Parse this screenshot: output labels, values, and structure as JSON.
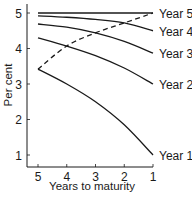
{
  "chart_data": {
    "type": "line",
    "title": "",
    "xlabel": "Years to maturity",
    "ylabel": "Per cent",
    "x_ticks": [
      5,
      4,
      3,
      2,
      1
    ],
    "y_ticks": [
      1,
      2,
      3,
      4,
      5
    ],
    "xlim": [
      5,
      1
    ],
    "ylim": [
      0.65,
      5.2
    ],
    "grid": false,
    "legend": "inline-right",
    "series": [
      {
        "name": "Year 5",
        "x": [
          5,
          4,
          3,
          2,
          1
        ],
        "values": [
          5.0,
          5.0,
          5.0,
          5.0,
          5.0
        ]
      },
      {
        "name": "Year 4",
        "x": [
          5,
          4,
          3,
          2,
          1
        ],
        "values": [
          4.92,
          4.88,
          4.82,
          4.72,
          4.5
        ]
      },
      {
        "name": "Year 3",
        "x": [
          5,
          4,
          3,
          2,
          1
        ],
        "values": [
          4.69,
          4.6,
          4.44,
          4.2,
          3.87
        ]
      },
      {
        "name": "Year 2",
        "x": [
          5,
          4,
          3,
          2,
          1
        ],
        "values": [
          4.3,
          4.07,
          3.8,
          3.45,
          3.0
        ]
      },
      {
        "name": "Year 1",
        "x": [
          5,
          4,
          3,
          2,
          1
        ],
        "values": [
          3.42,
          3.0,
          2.5,
          1.85,
          1.0
        ]
      }
    ],
    "envelope": {
      "name": "dashed-envelope",
      "style": "dashed",
      "x": [
        5,
        4,
        3,
        2,
        1
      ],
      "values": [
        3.42,
        4.07,
        4.44,
        4.72,
        5.0
      ]
    }
  }
}
